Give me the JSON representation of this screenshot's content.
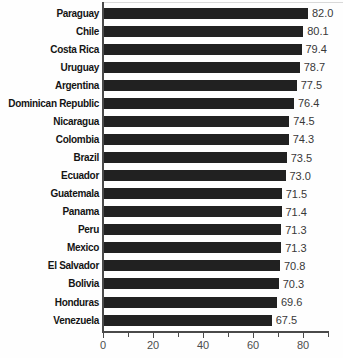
{
  "chart_data": {
    "type": "bar",
    "orientation": "horizontal",
    "title": "",
    "xlabel": "",
    "ylabel": "",
    "grid": false,
    "legend": "none",
    "background": "#fefefe",
    "bar_color": "#212121",
    "axis_color": "#4a4a4a",
    "xlim": [
      0,
      90
    ],
    "x_ticks": [
      0,
      10,
      20,
      30,
      40,
      50,
      60,
      70,
      80,
      90
    ],
    "x_tick_labeled_values": [
      0,
      20,
      40,
      60,
      80
    ],
    "x_tick_labels": [
      "0",
      "20",
      "40",
      "60",
      "80"
    ],
    "categories": [
      "Paraguay",
      "Chile",
      "Costa Rica",
      "Uruguay",
      "Argentina",
      "Dominican Republic",
      "Nicaragua",
      "Colombia",
      "Brazil",
      "Ecuador",
      "Guatemala",
      "Panama",
      "Peru",
      "Mexico",
      "El Salvador",
      "Bolivia",
      "Honduras",
      "Venezuela"
    ],
    "values": [
      82.0,
      80.1,
      79.4,
      78.7,
      77.5,
      76.4,
      74.5,
      74.3,
      73.5,
      73.0,
      71.5,
      71.4,
      71.3,
      71.3,
      70.8,
      70.3,
      69.6,
      67.5
    ],
    "value_labels": [
      "82.0",
      "80.1",
      "79.4",
      "78.7",
      "77.5",
      "76.4",
      "74.5",
      "74.3",
      "73.5",
      "73.0",
      "71.5",
      "71.4",
      "71.3",
      "71.3",
      "70.8",
      "70.3",
      "69.6",
      "67.5"
    ]
  }
}
